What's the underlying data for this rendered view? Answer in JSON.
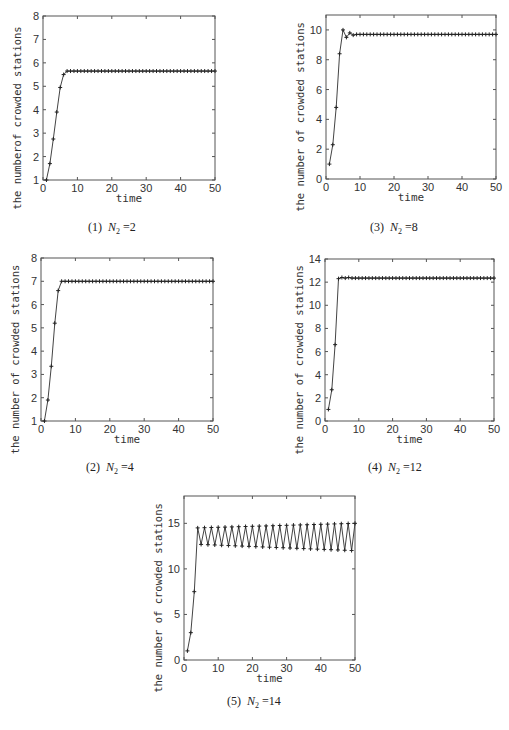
{
  "figure": {
    "panels": [
      {
        "id": "p1",
        "caption_prefix": "(1)",
        "caption_var": "N",
        "caption_sub": "2",
        "caption_eq": "=2"
      },
      {
        "id": "p2",
        "caption_prefix": "(2)",
        "caption_var": "N",
        "caption_sub": "2",
        "caption_eq": "=4"
      },
      {
        "id": "p3",
        "caption_prefix": "(3)",
        "caption_var": "N",
        "caption_sub": "2",
        "caption_eq": "=8"
      },
      {
        "id": "p4",
        "caption_prefix": "(4)",
        "caption_var": "N",
        "caption_sub": "2",
        "caption_eq": "=12"
      },
      {
        "id": "p5",
        "caption_prefix": "(5)",
        "caption_var": "N",
        "caption_sub": "2",
        "caption_eq": "=14"
      }
    ]
  },
  "chart_data": [
    {
      "type": "line",
      "title": "(1) N2=2",
      "xlabel": "time",
      "ylabel": "the numberof crowded stations",
      "xlim": [
        0,
        50
      ],
      "ylim": [
        1,
        8
      ],
      "xticks": [
        0,
        10,
        20,
        30,
        40,
        50
      ],
      "yticks": [
        1,
        2,
        3,
        4,
        5,
        6,
        7,
        8
      ],
      "marker": "+",
      "grid": false,
      "x_start": 1,
      "x_end": 50,
      "values_head": [
        1,
        1.7,
        2.75,
        3.9,
        4.95,
        5.5
      ],
      "steady_value": 5.65
    },
    {
      "type": "line",
      "title": "(2) N2=4",
      "xlabel": "time",
      "ylabel": "the number of crowded stations",
      "xlim": [
        0,
        50
      ],
      "ylim": [
        1,
        8
      ],
      "xticks": [
        0,
        10,
        20,
        30,
        40,
        50
      ],
      "yticks": [
        1,
        2,
        3,
        4,
        5,
        6,
        7,
        8
      ],
      "marker": "+",
      "grid": false,
      "x_start": 1,
      "x_end": 50,
      "values_head": [
        1,
        1.9,
        3.35,
        5.2,
        6.6
      ],
      "steady_value": 7.0
    },
    {
      "type": "line",
      "title": "(3) N2=8",
      "xlabel": "time",
      "ylabel": "the number of crowded stations",
      "xlim": [
        0,
        50
      ],
      "ylim": [
        0,
        11
      ],
      "xticks": [
        0,
        10,
        20,
        30,
        40,
        50
      ],
      "yticks": [
        0,
        2,
        4,
        6,
        8,
        10
      ],
      "marker": "+",
      "grid": false,
      "x_start": 1,
      "x_end": 50,
      "values_head": [
        1,
        2.3,
        4.8,
        8.4,
        10.0,
        9.5,
        9.8,
        9.65
      ],
      "steady_value": 9.7
    },
    {
      "type": "line",
      "title": "(4) N2=12",
      "xlabel": "time",
      "ylabel": "the number of crowded stations",
      "xlim": [
        0,
        50
      ],
      "ylim": [
        0,
        14
      ],
      "xticks": [
        0,
        10,
        20,
        30,
        40,
        50
      ],
      "yticks": [
        0,
        2,
        4,
        6,
        8,
        10,
        12,
        14
      ],
      "marker": "+",
      "grid": false,
      "x_start": 1,
      "x_end": 50,
      "values_head": [
        1,
        2.7,
        6.6,
        12.3,
        12.4,
        12.35,
        12.4,
        12.35
      ],
      "steady_value": 12.35
    },
    {
      "type": "line",
      "title": "(5) N2=14",
      "xlabel": "time",
      "ylabel": "the number of crowded stations",
      "xlim": [
        0,
        50
      ],
      "ylim": [
        0,
        18
      ],
      "xticks": [
        0,
        10,
        20,
        30,
        40,
        50
      ],
      "yticks": [
        0,
        5,
        10,
        15
      ],
      "marker": "+",
      "grid": false,
      "x_start": 1,
      "x_end": 50,
      "values_head": [
        1,
        3,
        7.5
      ],
      "oscillation": {
        "start_x": 4,
        "peak_start": 14.5,
        "peak_end": 15.0,
        "trough_start": 12.7,
        "trough_end": 12.0,
        "peaks_on": "even"
      }
    }
  ],
  "layout": [
    {
      "left": 43,
      "top": 16,
      "right": 215,
      "bottom": 180,
      "cap_x": 88,
      "cap_y": 220
    },
    {
      "left": 41,
      "top": 258,
      "right": 213,
      "bottom": 421,
      "cap_x": 86,
      "cap_y": 460
    },
    {
      "left": 326,
      "top": 15,
      "right": 496,
      "bottom": 179,
      "cap_x": 370,
      "cap_y": 220
    },
    {
      "left": 325,
      "top": 259,
      "right": 494,
      "bottom": 421,
      "cap_x": 368,
      "cap_y": 460
    },
    {
      "left": 184,
      "top": 496,
      "right": 355,
      "bottom": 660,
      "cap_x": 227,
      "cap_y": 694
    }
  ]
}
